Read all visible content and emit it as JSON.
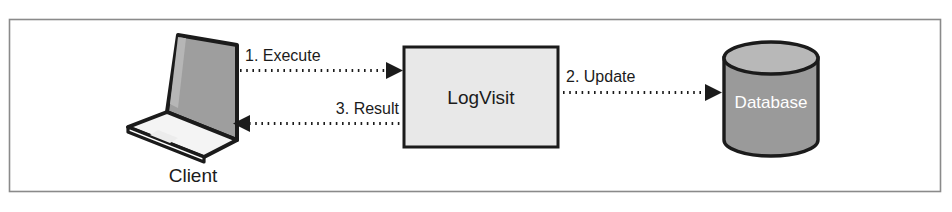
{
  "figure": {
    "type": "sequence-flow-diagram",
    "border_color": "#8a8a8a",
    "background": "#ffffff"
  },
  "nodes": [
    {
      "id": "client",
      "shape": "laptop-icon",
      "label": "Client",
      "label_position": "below",
      "screen_color": "#9e9e9e",
      "base_color": "#f2f2f2",
      "outline_color": "#1b1b1b"
    },
    {
      "id": "logvisit",
      "shape": "rectangle",
      "label": "LogVisit",
      "label_position": "center",
      "fill_color": "#e8e8e8",
      "outline_color": "#1b1b1b"
    },
    {
      "id": "database",
      "shape": "cylinder",
      "label": "Database",
      "label_position": "center",
      "fill_color": "#9a9a9a",
      "top_color": "#b8b8b8",
      "outline_color": "#1b1b1b",
      "label_color": "#ffffff"
    }
  ],
  "edges": [
    {
      "id": "execute",
      "label": "1. Execute",
      "from": "client",
      "to": "logvisit",
      "direction": "right",
      "style": "dotted",
      "arrowhead": "filled-triangle"
    },
    {
      "id": "result",
      "label": "3. Result",
      "from": "logvisit",
      "to": "client",
      "direction": "left",
      "style": "dotted",
      "arrowhead": "filled-triangle"
    },
    {
      "id": "update",
      "label": "2. Update",
      "from": "logvisit",
      "to": "database",
      "direction": "right",
      "style": "dotted",
      "arrowhead": "filled-triangle"
    }
  ]
}
